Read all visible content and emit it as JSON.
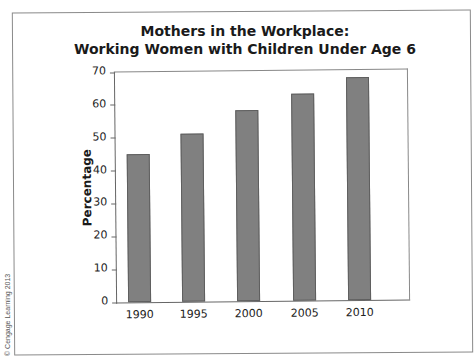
{
  "chart_data": {
    "type": "bar",
    "title_lines": [
      "Mothers in the Workplace:",
      "Working Women with Children Under Age 6"
    ],
    "xlabel": "",
    "ylabel": "Percentage",
    "categories": [
      "1990",
      "1995",
      "2000",
      "2005",
      "2010"
    ],
    "values": [
      45,
      51,
      58,
      63,
      68
    ],
    "ylim": [
      0,
      70
    ],
    "yticks": [
      0,
      10,
      20,
      30,
      40,
      50,
      60,
      70
    ],
    "grid": false,
    "legend": null,
    "bar_color": "#808080"
  },
  "credit": "© Cengage Learning 2013"
}
